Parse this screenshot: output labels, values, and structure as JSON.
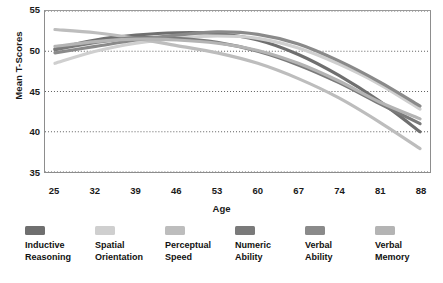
{
  "chart_data": {
    "type": "line",
    "title": "",
    "xlabel": "Age",
    "ylabel": "Mean T-Scores",
    "xticks": [
      25,
      32,
      39,
      46,
      53,
      60,
      67,
      74,
      81,
      88
    ],
    "yticks": [
      35,
      40,
      45,
      50,
      55
    ],
    "xlim": [
      25,
      88
    ],
    "ylim": [
      35,
      55
    ],
    "grid": true,
    "grid_style": "dotted-horizontal",
    "legend_position": "bottom",
    "x": [
      25,
      32,
      39,
      46,
      53,
      60,
      67,
      74,
      81,
      88
    ],
    "series": [
      {
        "name": "Inductive Reasoning",
        "color": "#6f6f6f",
        "values": [
          50.3,
          51.4,
          52.0,
          52.3,
          52.2,
          51.4,
          49.6,
          47.0,
          43.8,
          40.0
        ]
      },
      {
        "name": "Spatial Orientation",
        "color": "#cfcfcf",
        "values": [
          48.5,
          50.0,
          51.0,
          51.6,
          51.9,
          51.6,
          50.4,
          48.4,
          45.9,
          42.8
        ]
      },
      {
        "name": "Perceptual Speed",
        "color": "#bdbdbd",
        "values": [
          52.7,
          52.3,
          51.6,
          50.7,
          49.8,
          48.5,
          46.6,
          44.2,
          41.2,
          37.9
        ]
      },
      {
        "name": "Numeric Ability",
        "color": "#7a7a7a",
        "values": [
          50.2,
          51.1,
          51.7,
          51.6,
          51.1,
          50.0,
          48.3,
          46.1,
          43.5,
          41.0
        ]
      },
      {
        "name": "Verbal Ability",
        "color": "#8a8a8a",
        "values": [
          49.8,
          50.6,
          51.4,
          52.0,
          52.4,
          52.1,
          50.9,
          48.8,
          46.2,
          43.2
        ]
      },
      {
        "name": "Verbal Memory",
        "color": "#b4b4b4",
        "values": [
          50.6,
          51.2,
          51.5,
          51.4,
          51.0,
          50.1,
          48.5,
          46.3,
          43.7,
          41.6
        ]
      }
    ]
  },
  "axes": {
    "ylabel": "Mean T-Scores",
    "xlabel": "Age",
    "yticks": [
      "55",
      "50",
      "45",
      "40",
      "35"
    ],
    "xticks": [
      "25",
      "32",
      "39",
      "46",
      "53",
      "60",
      "67",
      "74",
      "81",
      "88"
    ]
  },
  "legend": {
    "items": [
      {
        "label": "Inductive\nReasoning",
        "color": "#6f6f6f"
      },
      {
        "label": "Spatial\nOrientation",
        "color": "#cfcfcf"
      },
      {
        "label": "Perceptual\nSpeed",
        "color": "#bdbdbd"
      },
      {
        "label": "Numeric\nAbility",
        "color": "#7a7a7a"
      },
      {
        "label": "Verbal\nAbility",
        "color": "#8a8a8a"
      },
      {
        "label": "Verbal\nMemory",
        "color": "#b4b4b4"
      }
    ]
  }
}
